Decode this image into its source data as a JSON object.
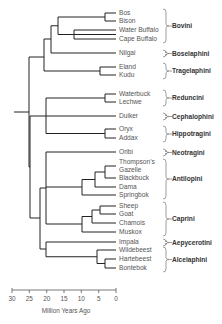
{
  "diagram": {
    "type": "phylogenetic-tree",
    "axis": {
      "title": "Million Years Ago",
      "ticks": [
        "30",
        "25",
        "20",
        "15",
        "10",
        "5",
        "0"
      ]
    },
    "taxa": [
      {
        "label": "Bos",
        "y": 13
      },
      {
        "label": "Bison",
        "y": 21
      },
      {
        "label": "Water Buffalo",
        "y": 30
      },
      {
        "label": "Cape Buffalo",
        "y": 39
      },
      {
        "label": "Nilgai",
        "y": 53
      },
      {
        "label": "Eland",
        "y": 67
      },
      {
        "label": "Kudu",
        "y": 75
      },
      {
        "label": "Waterbuck",
        "y": 94
      },
      {
        "label": "Lechwe",
        "y": 102
      },
      {
        "label": "Duiker",
        "y": 116
      },
      {
        "label": "Oryx",
        "y": 129
      },
      {
        "label": "Addax",
        "y": 138
      },
      {
        "label": "Oribi",
        "y": 152
      },
      {
        "label": "Thompson's",
        "y": 162
      },
      {
        "label": "Gazelle",
        "y": 170
      },
      {
        "label": "Blackbuck",
        "y": 178
      },
      {
        "label": "Dama",
        "y": 187
      },
      {
        "label": "Springbok",
        "y": 195
      },
      {
        "label": "Sheep",
        "y": 206
      },
      {
        "label": "Goat",
        "y": 214
      },
      {
        "label": "Chamois",
        "y": 223
      },
      {
        "label": "Muskox",
        "y": 232
      },
      {
        "label": "Impala",
        "y": 242
      },
      {
        "label": "Wildebeest",
        "y": 250
      },
      {
        "label": "Hartebeest",
        "y": 259
      },
      {
        "label": "Bontebok",
        "y": 268
      }
    ],
    "tribes": [
      {
        "label": "Bovini",
        "top": 9,
        "bottom": 43
      },
      {
        "label": "Boselaphini",
        "top": 50,
        "bottom": 57
      },
      {
        "label": "Tragelaphini",
        "top": 63,
        "bottom": 79
      },
      {
        "label": "Reduncini",
        "top": 90,
        "bottom": 106
      },
      {
        "label": "Cephalophini",
        "top": 113,
        "bottom": 120
      },
      {
        "label": "Hippotragini",
        "top": 126,
        "bottom": 142
      },
      {
        "label": "Neotragini",
        "top": 149,
        "bottom": 156
      },
      {
        "label": "Antilopini",
        "top": 159,
        "bottom": 199
      },
      {
        "label": "Caprini",
        "top": 202,
        "bottom": 236
      },
      {
        "label": "Aepycerotini",
        "top": 239,
        "bottom": 246
      },
      {
        "label": "Alcelaphini",
        "top": 247,
        "bottom": 272
      }
    ]
  }
}
